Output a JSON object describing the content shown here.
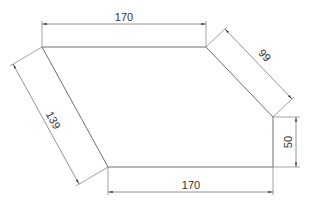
{
  "drawing": {
    "type": "technical-dimension-drawing",
    "units": "",
    "shape": {
      "name": "hexagonal-plate",
      "vertices": [
        [
          42,
          47
        ],
        [
          206,
          47
        ],
        [
          273,
          117
        ],
        [
          273,
          167
        ],
        [
          108,
          167
        ]
      ]
    },
    "dimensions": {
      "top": {
        "label": "170"
      },
      "upper_right": {
        "label": "99"
      },
      "right": {
        "label": "50"
      },
      "bottom": {
        "label": "170"
      },
      "left": {
        "label": "139"
      }
    },
    "colors": {
      "line": "#6e6e6e",
      "text": "#333333",
      "background": "#ffffff"
    }
  }
}
